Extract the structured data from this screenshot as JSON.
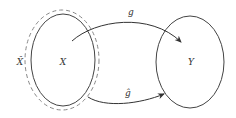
{
  "diagram": {
    "nodes": [
      {
        "id": "X_hat",
        "label": "X̂",
        "shape": "dashed-ellipse",
        "description": "dashed boundary enclosing X"
      },
      {
        "id": "X",
        "label": "X",
        "shape": "ellipse"
      },
      {
        "id": "Y",
        "label": "Y",
        "shape": "ellipse"
      }
    ],
    "edges": [
      {
        "id": "g",
        "from": "X",
        "to": "Y",
        "label": "g"
      },
      {
        "id": "g_hat",
        "from": "X",
        "to": "Y",
        "label": "ĝ"
      }
    ],
    "colors": {
      "stroke": "#444444",
      "dashed": "#888888",
      "text": "#333333",
      "background": "#ffffff"
    }
  }
}
